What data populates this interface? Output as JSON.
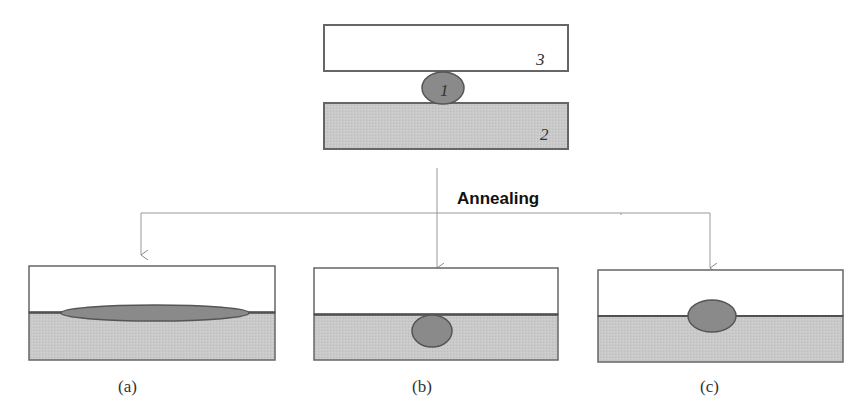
{
  "diagram": {
    "top": {
      "upper_plate_label": "3",
      "particle_label": "1",
      "substrate_label": "2"
    },
    "process_label": "Annealing",
    "outcomes": [
      {
        "id": "a",
        "caption": "(a)",
        "description": "particle spread as thin lens along interface"
      },
      {
        "id": "b",
        "caption": "(b)",
        "description": "particle embedded in lower substrate"
      },
      {
        "id": "c",
        "caption": "(c)",
        "description": "particle straddles interface"
      }
    ],
    "colors": {
      "substrate_fill": "#c9c9c9",
      "particle_fill": "#8a8a8a",
      "outline": "#555555",
      "arrow": "#999999",
      "plate_fill": "#ffffff"
    }
  }
}
